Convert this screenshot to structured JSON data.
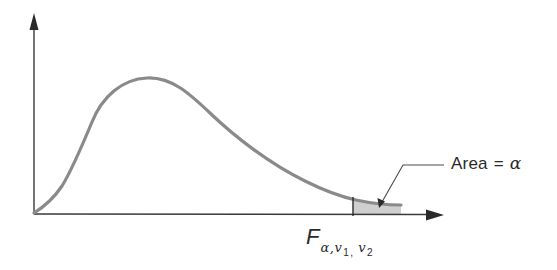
{
  "figure": {
    "annotations": {
      "area_label": {
        "word": "Area",
        "equals": "=",
        "symbol": "α"
      },
      "critical_value_label": {
        "main": "F",
        "subscript_alpha": "α,",
        "subscript_v1": "v",
        "subscript_v1_index": "1",
        "separator": ",",
        "subscript_v2": "v",
        "subscript_v2_index": "2"
      }
    },
    "colors": {
      "curve": "#8a8a8a",
      "axis": "#3a3a3a",
      "shaded_area": "#cfcfcf",
      "text": "#2a2a2a"
    }
  }
}
